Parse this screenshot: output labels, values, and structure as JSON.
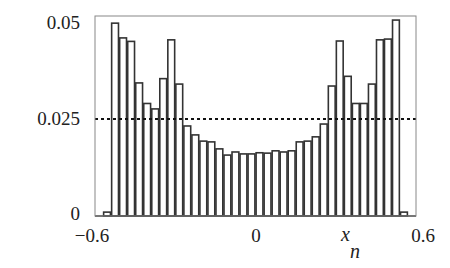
{
  "chart_data": {
    "type": "bar",
    "subtype": "histogram",
    "title": "",
    "xlabel": "x_n",
    "xlabel_main": "x",
    "xlabel_sub": "n",
    "ylabel": "",
    "xlim": [
      -0.6,
      0.6
    ],
    "ylim": [
      0,
      0.05
    ],
    "bins": 40,
    "bin_width": 0.03,
    "x_ticks": [
      {
        "value": -0.6,
        "label": "-0.6"
      },
      {
        "value": 0,
        "label": "0"
      },
      {
        "value": 0.6,
        "label": "0.6"
      }
    ],
    "y_ticks": [
      {
        "value": 0,
        "label": "0"
      },
      {
        "value": 0.025,
        "label": "0.025"
      },
      {
        "value": 0.05,
        "label": "0.05"
      }
    ],
    "reference_line": {
      "value": 0.025,
      "style": "dotted",
      "orientation": "horizontal"
    },
    "values": [
      0,
      0.001,
      0.0497,
      0.0459,
      0.045,
      0.0343,
      0.029,
      0.0276,
      0.0354,
      0.0454,
      0.034,
      0.0232,
      0.0209,
      0.0193,
      0.0191,
      0.0173,
      0.0157,
      0.0165,
      0.016,
      0.016,
      0.0163,
      0.0162,
      0.0168,
      0.0165,
      0.0168,
      0.0191,
      0.0193,
      0.0204,
      0.0237,
      0.0335,
      0.0451,
      0.036,
      0.029,
      0.029,
      0.034,
      0.0454,
      0.0456,
      0.0505,
      0.001,
      0
    ],
    "grid": false,
    "legend": null,
    "colors": {
      "bar_fill": "#ffffff",
      "bar_edge": "#333333",
      "frame": "#888888",
      "reference_line": "#111111"
    }
  },
  "labels": {
    "y_top": "0.05",
    "y_mid": "0.025",
    "y_zero": "0",
    "x_left": "−0.6",
    "x_mid": "0",
    "x_right": "0.6",
    "x_var": "x",
    "x_var_sub": "n"
  }
}
